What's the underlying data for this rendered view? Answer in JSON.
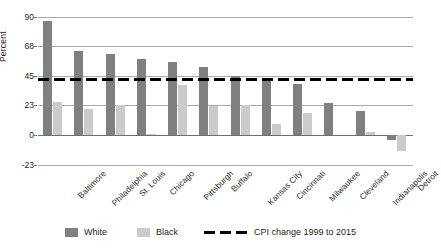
{
  "chart_data": {
    "type": "bar",
    "title": "",
    "xlabel": "",
    "ylabel": "Percent",
    "ylim": [
      -23,
      90
    ],
    "yticks": [
      90,
      68,
      45,
      23,
      0,
      -23
    ],
    "ytick_labels": [
      "90",
      "68",
      "45",
      "23",
      "0",
      "-23"
    ],
    "grid": true,
    "legend_position": "bottom",
    "categories": [
      "Baltimore",
      "Philadelphia",
      "St. Louis",
      "Chicago",
      "Pittsburgh",
      "Buffalo",
      "Kansas City",
      "Cincinnati",
      "Milwaukee",
      "Cleveland",
      "Indianapolis",
      "Detroit"
    ],
    "series": [
      {
        "name": "White",
        "color": "#808080",
        "values": [
          87,
          64,
          62,
          58,
          56,
          52,
          45,
          42,
          39,
          24,
          18,
          -4
        ]
      },
      {
        "name": "Black",
        "color": "#cbcbcb",
        "values": [
          25,
          20,
          23,
          1,
          38,
          22,
          23,
          8,
          17,
          0,
          2,
          -12
        ]
      }
    ],
    "reference_line": {
      "label": "CPI change 1999 to 2015",
      "value": 43,
      "style": "dashed",
      "color": "#000000"
    }
  },
  "legend": {
    "items": [
      {
        "label": "White",
        "swatch": "white-series-swatch"
      },
      {
        "label": "Black",
        "swatch": "black-series-swatch"
      },
      {
        "label": "CPI change 1999 to 2015",
        "swatch": "dashed-line-swatch"
      }
    ]
  }
}
